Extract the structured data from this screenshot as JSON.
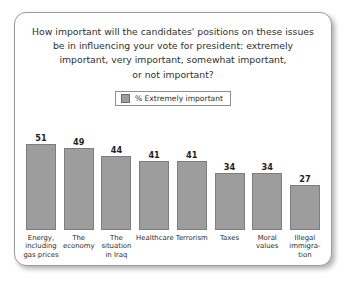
{
  "chart_data": {
    "type": "bar",
    "title": "How important will the candidates' positions on these issues\nbe in influencing your vote for president: extremely\nimportant, very important, somewhat important,\nor not important?",
    "xlabel": "",
    "ylabel": "",
    "ylim": [
      0,
      60
    ],
    "grid": false,
    "legend_position": "top-center",
    "legend": [
      "% Extremely important"
    ],
    "series_color": "#9d9d9d",
    "categories": [
      "Energy,\nincluding\ngas prices",
      "The\neconomy",
      "The\nsituation\nin Iraq",
      "Healthcare",
      "Terrorism",
      "Taxes",
      "Moral\nvalues",
      "Illegal\nimmigra-\ntion"
    ],
    "values": [
      51,
      49,
      44,
      41,
      41,
      34,
      34,
      27
    ],
    "series": [
      {
        "name": "% Extremely important",
        "values": [
          51,
          49,
          44,
          41,
          41,
          34,
          34,
          27
        ]
      }
    ]
  },
  "legend": {
    "swatch_color": "#9d9d9d",
    "label": "% Extremely important"
  }
}
